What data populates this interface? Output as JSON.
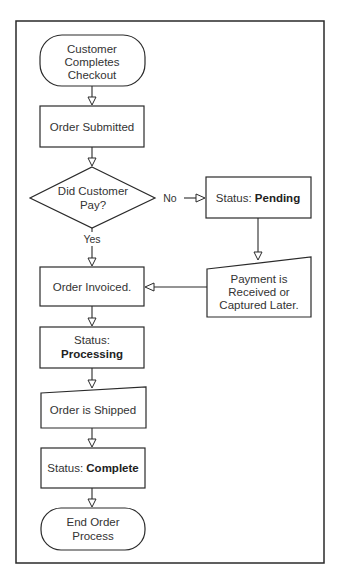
{
  "nodes": {
    "start": {
      "lines": [
        "Customer",
        "Completes",
        "Checkout"
      ]
    },
    "submitted": {
      "text": "Order Submitted"
    },
    "decision": {
      "lines": [
        "Did Customer",
        "Pay?"
      ]
    },
    "pending": {
      "prefix": "Status: ",
      "status": "Pending"
    },
    "payment_later": {
      "lines": [
        "Payment is",
        "Received or",
        "Captured Later."
      ]
    },
    "invoiced": {
      "text": "Order Invoiced."
    },
    "processing": {
      "prefix": "Status:",
      "status": "Processing"
    },
    "shipped": {
      "text": "Order is Shipped"
    },
    "complete": {
      "prefix": "Status: ",
      "status": "Complete"
    },
    "end": {
      "lines": [
        "End Order",
        "Process"
      ]
    }
  },
  "edges": {
    "no_label": "No",
    "yes_label": "Yes"
  }
}
